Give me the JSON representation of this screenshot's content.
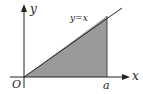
{
  "diagram": {
    "axes": {
      "x_label": "x",
      "y_label": "y",
      "origin_label": "O"
    },
    "line_label": "y=x",
    "point_label": "a",
    "colors": {
      "fill": "#9a9a9a",
      "stroke": "#222222"
    }
  }
}
